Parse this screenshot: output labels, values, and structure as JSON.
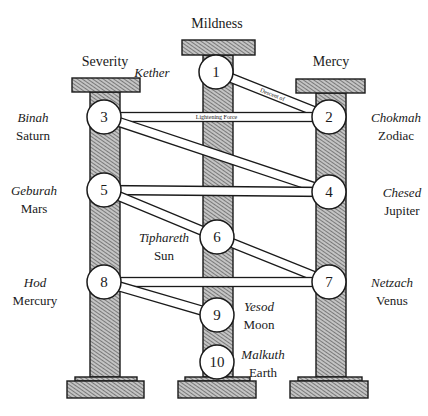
{
  "diagram": {
    "colors": {
      "ink": "#1a1a1a",
      "hatch_fill": "#bdbdbd",
      "hatch_line": "#3a3a3a",
      "background": "#ffffff",
      "circle_fill": "#ffffff"
    },
    "pillars": [
      {
        "id": "left",
        "title": "Severity",
        "title_x": 105,
        "title_y": 66,
        "cap": {
          "x": 72,
          "y": 78,
          "w": 68,
          "h": 14
        },
        "shaft": {
          "x": 90,
          "y": 92,
          "w": 30,
          "h": 285
        },
        "plinth": {
          "x": 75,
          "y": 377,
          "w": 62,
          "h": 4
        },
        "base": {
          "x": 67,
          "y": 381,
          "w": 77,
          "h": 17
        }
      },
      {
        "id": "center",
        "title": "Mildness",
        "title_x": 217,
        "title_y": 28,
        "cap": {
          "x": 182,
          "y": 40,
          "w": 73,
          "h": 15
        },
        "shaft": {
          "x": 203,
          "y": 55,
          "w": 30,
          "h": 322
        },
        "plinth": {
          "x": 185,
          "y": 377,
          "w": 65,
          "h": 4
        },
        "base": {
          "x": 178,
          "y": 381,
          "w": 78,
          "h": 17
        }
      },
      {
        "id": "right",
        "title": "Mercy",
        "title_x": 331,
        "title_y": 66,
        "cap": {
          "x": 296,
          "y": 79,
          "w": 69,
          "h": 14
        },
        "shaft": {
          "x": 316,
          "y": 93,
          "w": 30,
          "h": 284
        },
        "plinth": {
          "x": 298,
          "y": 377,
          "w": 64,
          "h": 4
        },
        "base": {
          "x": 290,
          "y": 381,
          "w": 78,
          "h": 17
        }
      }
    ],
    "sephiroth": [
      {
        "number": "1",
        "name": "Kether",
        "planet": "",
        "cx": 216,
        "cy": 72,
        "label_x": 152,
        "label_y": 77,
        "anchor": "middle"
      },
      {
        "number": "2",
        "name": "Chokmah",
        "planet": "Zodiac",
        "cx": 329,
        "cy": 117,
        "label_x": 396,
        "label_y": 122,
        "anchor": "middle"
      },
      {
        "number": "3",
        "name": "Binah",
        "planet": "Saturn",
        "cx": 104,
        "cy": 117,
        "label_x": 33,
        "label_y": 122,
        "anchor": "middle"
      },
      {
        "number": "4",
        "name": "Chesed",
        "planet": "Jupiter",
        "cx": 329,
        "cy": 192,
        "label_x": 402,
        "label_y": 197,
        "anchor": "middle"
      },
      {
        "number": "5",
        "name": "Geburah",
        "planet": "Mars",
        "cx": 104,
        "cy": 190,
        "label_x": 34,
        "label_y": 195,
        "anchor": "middle"
      },
      {
        "number": "6",
        "name": "Tiphareth",
        "planet": "Sun",
        "cx": 217,
        "cy": 237,
        "label_x": 164,
        "label_y": 242,
        "anchor": "middle"
      },
      {
        "number": "7",
        "name": "Netzach",
        "planet": "Venus",
        "cx": 329,
        "cy": 282,
        "label_x": 392,
        "label_y": 287,
        "anchor": "middle"
      },
      {
        "number": "8",
        "name": "Hod",
        "planet": "Mercury",
        "cx": 104,
        "cy": 282,
        "label_x": 35,
        "label_y": 287,
        "anchor": "middle"
      },
      {
        "number": "9",
        "name": "Yesod",
        "planet": "Moon",
        "cx": 217,
        "cy": 315,
        "label_x": 259,
        "label_y": 311,
        "anchor": "middle"
      },
      {
        "number": "10",
        "name": "Malkuth",
        "planet": "Earth",
        "cx": 217,
        "cy": 362,
        "label_x": 263,
        "label_y": 359,
        "anchor": "middle"
      }
    ],
    "circle_radius": 17,
    "paths": [
      {
        "from": "1",
        "to": "2",
        "label": "Descent of"
      },
      {
        "from": "2",
        "to": "3",
        "label": "Lightening Force"
      },
      {
        "from": "3",
        "to": "4",
        "label": ""
      },
      {
        "from": "4",
        "to": "5",
        "label": ""
      },
      {
        "from": "5",
        "to": "6",
        "label": ""
      },
      {
        "from": "6",
        "to": "7",
        "label": ""
      },
      {
        "from": "7",
        "to": "8",
        "label": ""
      },
      {
        "from": "8",
        "to": "9",
        "label": ""
      }
    ],
    "path_width": 9
  }
}
